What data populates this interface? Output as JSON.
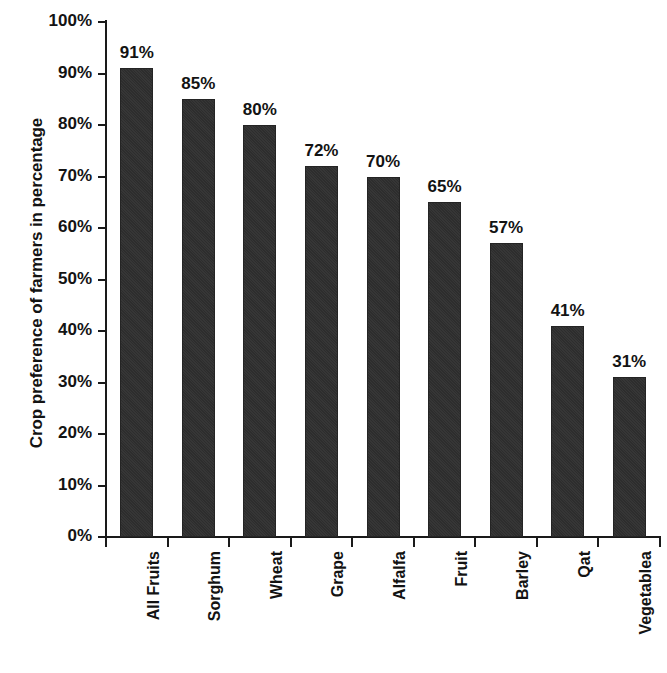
{
  "chart_data": {
    "type": "bar",
    "title": "",
    "subtitle": "",
    "xlabel": "",
    "ylabel": "Crop preference of farmers in percentage",
    "ylim": [
      0,
      100
    ],
    "grid": false,
    "legend": "none",
    "orientation": "vertical",
    "bar_color": "#2d2d2d",
    "background_color": "#ffffff",
    "axis_color": "#1a1a1a",
    "y_tick_labels": [
      "0%",
      "10%",
      "20%",
      "30%",
      "40%",
      "50%",
      "60%",
      "70%",
      "80%",
      "90%",
      "100%"
    ],
    "y_tick_values": [
      0,
      10,
      20,
      30,
      40,
      50,
      60,
      70,
      80,
      90,
      100
    ],
    "categories": [
      "All Fruits",
      "Sorghum",
      "Wheat",
      "Grape",
      "Alfalfa",
      "Fruit",
      "Barley",
      "Qat",
      "Vegetablea"
    ],
    "values": [
      91,
      85,
      80,
      72,
      70,
      65,
      57,
      41,
      31
    ],
    "data_labels": [
      "91%",
      "85%",
      "80%",
      "72%",
      "70%",
      "65%",
      "57%",
      "41%",
      "31%"
    ],
    "bars": [
      {
        "category": "All Fruits",
        "value": 91,
        "label": "91%"
      },
      {
        "category": "Sorghum",
        "value": 85,
        "label": "85%"
      },
      {
        "category": "Wheat",
        "value": 80,
        "label": "80%"
      },
      {
        "category": "Grape",
        "value": 72,
        "label": "72%"
      },
      {
        "category": "Alfalfa",
        "value": 70,
        "label": "70%"
      },
      {
        "category": "Fruit",
        "value": 65,
        "label": "65%"
      },
      {
        "category": "Barley",
        "value": 57,
        "label": "57%"
      },
      {
        "category": "Qat",
        "value": 41,
        "label": "41%"
      },
      {
        "category": "Vegetablea",
        "value": 31,
        "label": "31%"
      }
    ]
  }
}
